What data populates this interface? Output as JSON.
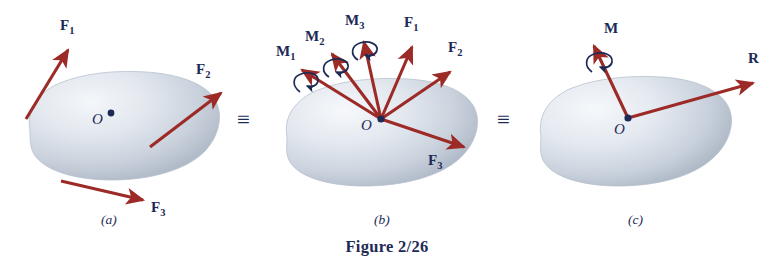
{
  "figure": {
    "caption": "Figure 2/26",
    "equivalence_symbol_1": "≡",
    "equivalence_symbol_2": "≡",
    "colors": {
      "vector_red": "#9c2a26",
      "label_navy": "#1d2a56",
      "body_light": "#e8ecf2",
      "body_mid": "#c3cbd6",
      "body_shadow": "#9aa5b4",
      "background": "#ffffff"
    }
  },
  "panels": [
    {
      "id": "panel-a",
      "label": "(a)",
      "point_label": "O",
      "vectors": [
        {
          "name": "F1",
          "label": "F",
          "subscript": "1",
          "type": "force"
        },
        {
          "name": "F2",
          "label": "F",
          "subscript": "2",
          "type": "force"
        },
        {
          "name": "F3",
          "label": "F",
          "subscript": "3",
          "type": "force"
        }
      ]
    },
    {
      "id": "panel-b",
      "label": "(b)",
      "point_label": "O",
      "vectors": [
        {
          "name": "M1",
          "label": "M",
          "subscript": "1",
          "type": "moment"
        },
        {
          "name": "M2",
          "label": "M",
          "subscript": "2",
          "type": "moment"
        },
        {
          "name": "M3",
          "label": "M",
          "subscript": "3",
          "type": "moment"
        },
        {
          "name": "F1",
          "label": "F",
          "subscript": "1",
          "type": "force"
        },
        {
          "name": "F2",
          "label": "F",
          "subscript": "2",
          "type": "force"
        },
        {
          "name": "F3",
          "label": "F",
          "subscript": "3",
          "type": "force"
        }
      ]
    },
    {
      "id": "panel-c",
      "label": "(c)",
      "point_label": "O",
      "vectors": [
        {
          "name": "M",
          "label": "M",
          "subscript": "",
          "type": "moment"
        },
        {
          "name": "R",
          "label": "R",
          "subscript": "",
          "type": "force"
        }
      ]
    }
  ]
}
